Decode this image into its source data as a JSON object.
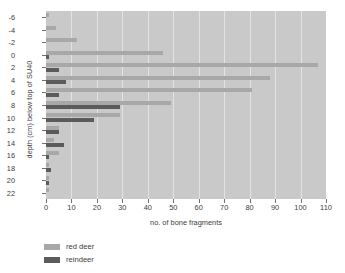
{
  "chart_data": {
    "type": "bar",
    "orientation": "horizontal",
    "title": "",
    "xlabel": "no. of bone fragments",
    "ylabel": "depth (cm) below top of SU40",
    "xlim": [
      0,
      110
    ],
    "xticks": [
      0,
      10,
      20,
      30,
      40,
      50,
      60,
      70,
      80,
      90,
      100,
      110
    ],
    "yticks": [
      -6,
      -4,
      -2,
      0,
      2,
      4,
      6,
      8,
      10,
      12,
      14,
      16,
      18,
      20,
      22
    ],
    "categories": [
      -6,
      -4,
      -2,
      0,
      2,
      4,
      6,
      8,
      10,
      12,
      14,
      16,
      18,
      20,
      22
    ],
    "grid": "vertical",
    "legend_position": "below-left",
    "series": [
      {
        "name": "red deer",
        "color": "#a8a8a8",
        "values": [
          1,
          4,
          12,
          46,
          107,
          88,
          81,
          49,
          29,
          5,
          3,
          5,
          1,
          1,
          1
        ]
      },
      {
        "name": "reindeer",
        "color": "#5b5b5b",
        "values": [
          0,
          0,
          0,
          1,
          5,
          8,
          5,
          29,
          19,
          5,
          7,
          1,
          2,
          1,
          0
        ]
      }
    ]
  },
  "legend": {
    "items": [
      {
        "label": "red deer",
        "color": "#a8a8a8"
      },
      {
        "label": "reindeer",
        "color": "#5b5b5b"
      }
    ]
  },
  "plot_background": "#c9c9c9",
  "gridline_color": "#e3e3e3",
  "page_background": "#ffffff"
}
